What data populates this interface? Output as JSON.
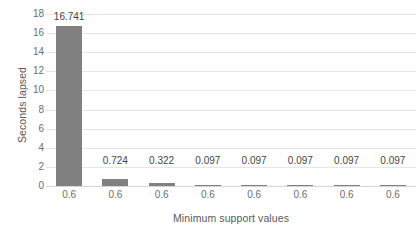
{
  "chart_data": {
    "type": "bar",
    "title": "",
    "xlabel": "Minimum support values",
    "ylabel": "Seconds lapsed",
    "categories": [
      "0.6",
      "0.6",
      "0.6",
      "0.6",
      "0.6",
      "0.6",
      "0.6",
      "0.6"
    ],
    "values": [
      16.741,
      0.724,
      0.322,
      0.097,
      0.097,
      0.097,
      0.097,
      0.097
    ],
    "data_labels": [
      "16.741",
      "0.724",
      "0.322",
      "0.097",
      "0.097",
      "0.097",
      "0.097",
      "0.097"
    ],
    "ylim": [
      0,
      18
    ],
    "ytick_step": 2,
    "yticks": [
      "0",
      "2",
      "4",
      "6",
      "8",
      "10",
      "12",
      "14",
      "16",
      "18"
    ],
    "grid": true,
    "legend": false,
    "series_color": "#808080",
    "gridline_color": "#e6e6e6",
    "axis_text_color": "#6e6e6e",
    "label_text_color": "#454545"
  }
}
